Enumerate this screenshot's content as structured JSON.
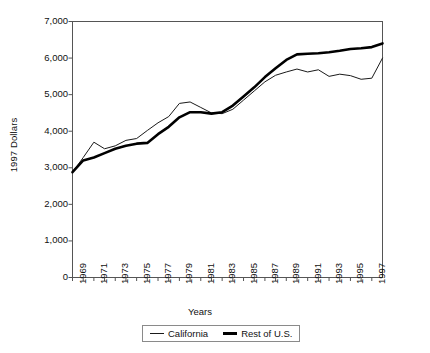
{
  "chart_data": {
    "type": "line",
    "title": "",
    "xlabel": "Years",
    "ylabel": "1997 Dollars",
    "xlim": [
      1969,
      1998
    ],
    "ylim": [
      0,
      7000
    ],
    "yticks": [
      "0",
      "1,000",
      "2,000",
      "3,000",
      "4,000",
      "5,000",
      "6,000",
      "7,000"
    ],
    "ytick_values": [
      0,
      1000,
      2000,
      3000,
      4000,
      5000,
      6000,
      7000
    ],
    "xticks": [
      "1969",
      "1971",
      "1973",
      "1975",
      "1977",
      "1979",
      "1981",
      "1983",
      "1985",
      "1987",
      "1989",
      "1991",
      "1993",
      "1995",
      "1997"
    ],
    "xtick_values": [
      1969,
      1971,
      1973,
      1975,
      1977,
      1979,
      1981,
      1983,
      1985,
      1987,
      1989,
      1991,
      1993,
      1995,
      1997
    ],
    "grid": false,
    "legend_position": "bottom",
    "x": [
      1969,
      1970,
      1971,
      1972,
      1973,
      1974,
      1975,
      1976,
      1977,
      1978,
      1979,
      1980,
      1981,
      1982,
      1983,
      1984,
      1985,
      1986,
      1987,
      1988,
      1989,
      1990,
      1991,
      1992,
      1993,
      1994,
      1995,
      1996,
      1997,
      1998
    ],
    "series": [
      {
        "name": "California",
        "style": "thin",
        "color": "#1a1a1a",
        "values": [
          2880,
          3280,
          3700,
          3520,
          3600,
          3750,
          3800,
          4020,
          4230,
          4400,
          4760,
          4800,
          4650,
          4500,
          4480,
          4600,
          4850,
          5100,
          5350,
          5530,
          5620,
          5700,
          5620,
          5680,
          5500,
          5560,
          5520,
          5420,
          5450,
          6000
        ]
      },
      {
        "name": "Rest of U.S.",
        "style": "thick",
        "color": "#000000",
        "values": [
          2880,
          3200,
          3280,
          3400,
          3520,
          3600,
          3660,
          3680,
          3920,
          4120,
          4380,
          4520,
          4520,
          4480,
          4520,
          4700,
          4950,
          5200,
          5480,
          5720,
          5950,
          6100,
          6120,
          6130,
          6160,
          6200,
          6250,
          6270,
          6300,
          6400
        ]
      }
    ]
  },
  "legend": {
    "entries": [
      {
        "label": "California"
      },
      {
        "label": "Rest of U.S."
      }
    ]
  },
  "axes": {
    "y_title": "1997 Dollars",
    "x_title": "Years"
  },
  "colors": {
    "plot_border": "#555555",
    "axis_text": "#111111",
    "series_california": "#1a1a1a",
    "series_rest_of_us": "#000000",
    "background": "#ffffff"
  }
}
